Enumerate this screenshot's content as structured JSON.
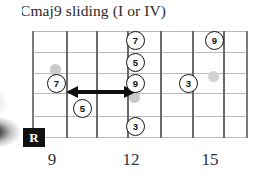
{
  "title": "Cmaj9 sliding (I or IV)",
  "diagram": {
    "type": "guitar-fretboard",
    "strings": 6,
    "fret_lines": 8,
    "fret_labels": [
      {
        "label": "9",
        "x": 52
      },
      {
        "label": "12",
        "x": 131
      },
      {
        "label": "15",
        "x": 210
      }
    ],
    "root_marker": {
      "label": "R"
    },
    "notes": [
      {
        "label": "7",
        "fret": 9,
        "string": 4,
        "x": 56,
        "y": 83
      },
      {
        "label": "5",
        "fret": 10,
        "string": 5,
        "x": 82,
        "y": 108
      },
      {
        "label": "7",
        "fret": 12,
        "string": 2,
        "x": 135,
        "y": 40
      },
      {
        "label": "5",
        "fret": 12,
        "string": 3,
        "x": 135,
        "y": 62
      },
      {
        "label": "9",
        "fret": 12,
        "string": 4,
        "x": 135,
        "y": 83
      },
      {
        "label": "3",
        "fret": 12,
        "string": 6,
        "x": 135,
        "y": 126
      },
      {
        "label": "3",
        "fret": 14,
        "string": 4,
        "x": 188,
        "y": 83
      },
      {
        "label": "9",
        "fret": 15,
        "string": 2,
        "x": 214,
        "y": 40
      }
    ],
    "inlays": [
      {
        "x": 56,
        "y": 69
      },
      {
        "x": 135,
        "y": 97
      },
      {
        "x": 214,
        "y": 76
      }
    ],
    "slide": {
      "from_x": 68,
      "to_x": 130,
      "y": 92,
      "direction": "bidirectional"
    }
  }
}
